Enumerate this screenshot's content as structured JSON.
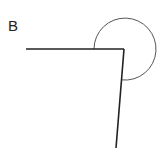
{
  "figure": {
    "panel_label": "B",
    "vertex": [
      124,
      49
    ],
    "ray1_end": [
      26,
      49
    ],
    "ray2_end": [
      116,
      148
    ],
    "arc_radius": 31,
    "line_color": "#222222",
    "arc_color": "#555555"
  }
}
